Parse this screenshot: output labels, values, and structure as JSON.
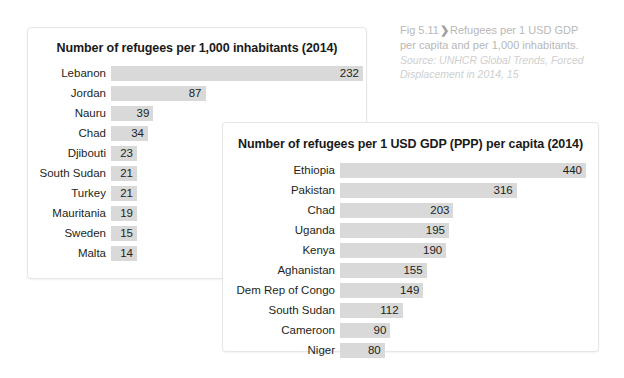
{
  "caption": {
    "figure_number": "Fig 5.11",
    "arrow_icon": "chevron-right-icon",
    "arrow_glyph": "❯",
    "title": "Refugees per 1 USD GDP per capita and per 1,000 inhabitants.",
    "source": "Source: UNHCR Global Trends, Forced Displacement in 2014, 15"
  },
  "colors": {
    "bar_fill": "#d9d9d9",
    "panel_border": "#e6e6e6",
    "text": "#231f20",
    "caption_text": "#b8b8b8",
    "caption_source_text": "#cfcfcf",
    "background": "#ffffff"
  },
  "chart_data": [
    {
      "type": "bar",
      "orientation": "horizontal",
      "title": "Number of refugees per 1,000 inhabitants (2014)",
      "xlabel": "",
      "ylabel": "",
      "grid": false,
      "legend": "none",
      "xlim": [
        0,
        232
      ],
      "categories": [
        "Lebanon",
        "Jordan",
        "Nauru",
        "Chad",
        "Djibouti",
        "South Sudan",
        "Turkey",
        "Mauritania",
        "Sweden",
        "Malta"
      ],
      "values": [
        232,
        87,
        39,
        34,
        23,
        21,
        21,
        19,
        15,
        14
      ]
    },
    {
      "type": "bar",
      "orientation": "horizontal",
      "title": "Number of refugees per 1 USD GDP (PPP) per capita (2014)",
      "xlabel": "",
      "ylabel": "",
      "grid": false,
      "legend": "none",
      "xlim": [
        0,
        440
      ],
      "categories": [
        "Ethiopia",
        "Pakistan",
        "Chad",
        "Uganda",
        "Kenya",
        "Aghanistan",
        "Dem Rep of Congo",
        "South Sudan",
        "Cameroon",
        "Niger"
      ],
      "values": [
        440,
        316,
        203,
        195,
        190,
        155,
        149,
        112,
        90,
        80
      ]
    }
  ]
}
